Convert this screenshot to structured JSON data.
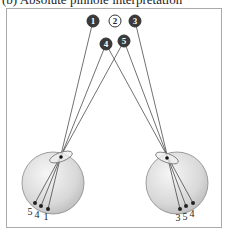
{
  "caption": "(b) Absolute pinhole interpretation",
  "points": [
    {
      "label": "1",
      "x": 93,
      "y": 21,
      "filled": true
    },
    {
      "label": "2",
      "x": 115,
      "y": 21,
      "filled": false
    },
    {
      "label": "3",
      "x": 135,
      "y": 21,
      "filled": true
    },
    {
      "label": "4",
      "x": 106,
      "y": 44,
      "filled": true
    },
    {
      "label": "5",
      "x": 124,
      "y": 41,
      "filled": true
    }
  ],
  "left_eye": {
    "center": [
      53,
      183
    ],
    "radius": 31,
    "pupil": [
      61,
      157
    ],
    "retina": [
      {
        "label": "5",
        "x": 35,
        "y": 203,
        "lx": 30,
        "ly": 215
      },
      {
        "label": "4",
        "x": 41,
        "y": 206,
        "lx": 37,
        "ly": 218
      },
      {
        "label": "1",
        "x": 48,
        "y": 209,
        "lx": 46,
        "ly": 220
      }
    ]
  },
  "right_eye": {
    "center": [
      177,
      183
    ],
    "radius": 31,
    "pupil": [
      167,
      158
    ],
    "retina": [
      {
        "label": "3",
        "x": 180,
        "y": 209,
        "lx": 178,
        "ly": 221
      },
      {
        "label": "5",
        "x": 186,
        "y": 206,
        "lx": 185,
        "ly": 220
      },
      {
        "label": "4",
        "x": 193,
        "y": 203,
        "lx": 192,
        "ly": 217
      }
    ]
  },
  "colors": {
    "dark_point": "#3a3a3a",
    "line": "#333333",
    "eye_fill": "#dcdcdc",
    "frame": "#aaaaaa"
  }
}
